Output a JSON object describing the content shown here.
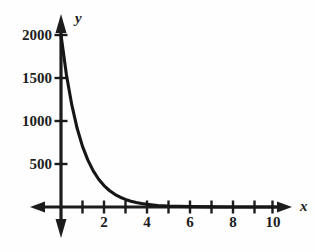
{
  "chart_data": {
    "type": "line",
    "title": "",
    "subtitle": "",
    "xlabel": "x",
    "ylabel": "y",
    "xlim": [
      0,
      10
    ],
    "ylim": [
      0,
      2000
    ],
    "grid": false,
    "legend": null,
    "x_ticks": [
      1,
      2,
      3,
      4,
      5,
      6,
      7,
      8,
      9,
      10
    ],
    "x_tick_labels": [
      "",
      "2",
      "",
      "4",
      "",
      "6",
      "",
      "8",
      "",
      "10"
    ],
    "y_ticks": [
      500,
      1000,
      1500,
      2000
    ],
    "y_tick_labels": [
      "500",
      "1000",
      "1500",
      "2000"
    ],
    "annotations": [],
    "series": [
      {
        "name": "exponential decay",
        "x": [
          0,
          0.25,
          0.5,
          0.75,
          1,
          1.25,
          1.5,
          1.75,
          2,
          2.25,
          2.5,
          2.75,
          3,
          3.25,
          3.5,
          3.75,
          4,
          4.5,
          5,
          5.5,
          6,
          7,
          8,
          9,
          10
        ],
        "y": [
          2000,
          1540,
          1190,
          915,
          705,
          545,
          420,
          323,
          249,
          192,
          148,
          114,
          88,
          68,
          52,
          40,
          31,
          18,
          11,
          7,
          4,
          1.5,
          0.6,
          0.2,
          0.1
        ]
      }
    ]
  },
  "axes": {
    "x_axis_name": "x",
    "y_axis_name": "y",
    "x_tick_labels": [
      {
        "text": "2",
        "value": 2
      },
      {
        "text": "4",
        "value": 4
      },
      {
        "text": "6",
        "value": 6
      },
      {
        "text": "8",
        "value": 8
      },
      {
        "text": "10",
        "value": 10
      }
    ],
    "y_tick_labels": [
      {
        "text": "2000",
        "value": 2000
      },
      {
        "text": "1500",
        "value": 1500
      },
      {
        "text": "1000",
        "value": 1000
      },
      {
        "text": "500",
        "value": 500
      }
    ]
  },
  "colors": {
    "ink": "#1c1c1c",
    "curve": "#161616",
    "background": "#fefefe"
  }
}
